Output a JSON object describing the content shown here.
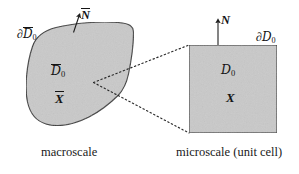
{
  "figure": {
    "background": "#ffffff",
    "line_color": "#3a3a3a",
    "fill_color": "#c9c9c9",
    "text_color": "#141414",
    "width": 299,
    "height": 174
  },
  "macroscale": {
    "caption": "macroscale",
    "boundary_label": {
      "partial": "∂",
      "domain": "D",
      "subscript": "0"
    },
    "normal_label": "N",
    "domain_label": {
      "domain": "D",
      "subscript": "0"
    },
    "position_label": "X",
    "overbar": true,
    "shape": "blob"
  },
  "microscale": {
    "caption": "microscale (unit cell)",
    "boundary_label": {
      "partial": "∂",
      "domain": "D",
      "subscript": "0"
    },
    "normal_label": "N",
    "domain_label": {
      "domain": "D",
      "subscript": "0"
    },
    "position_label": "X",
    "overbar": false,
    "shape": "square"
  },
  "connector": {
    "style": "dotted",
    "description": "two dotted lines fanning from a point inside the macroscale domain to the top-left and bottom-left corners of the microscale unit cell"
  }
}
